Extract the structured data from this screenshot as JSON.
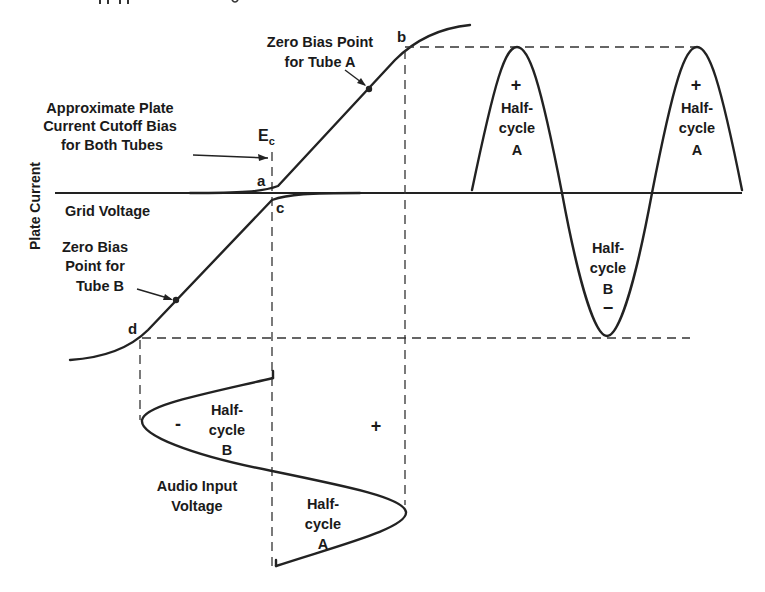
{
  "diagram": {
    "type": "class-B push-pull amplifier transfer characteristic",
    "axis_labels": {
      "vertical": "Plate Current",
      "horizontal": "Grid Voltage"
    },
    "cutoff_annotation": {
      "lines": [
        "Approximate Plate",
        "Current Cutoff Bias",
        "for Both Tubes"
      ],
      "symbol": "E",
      "symbol_subscript": "c"
    },
    "point_labels": {
      "a": "a",
      "b": "b",
      "c": "c",
      "d": "d"
    },
    "zero_bias_a": {
      "lines": [
        "Zero Bias Point",
        "for Tube A"
      ]
    },
    "zero_bias_b": {
      "lines": [
        "Zero Bias",
        "Point for",
        "Tube B"
      ]
    },
    "output_waveform": {
      "half_cycles": [
        {
          "sign": "+",
          "lines": [
            "Half-",
            "cycle",
            "A"
          ]
        },
        {
          "sign": "−",
          "lines": [
            "Half-",
            "cycle",
            "B"
          ]
        },
        {
          "sign": "+",
          "lines": [
            "Half-",
            "cycle",
            "A"
          ]
        }
      ]
    },
    "input_waveform": {
      "label_lines": [
        "Audio Input",
        "Voltage"
      ],
      "half_cycle_b": {
        "sign": "-",
        "lines": [
          "Half-",
          "cycle",
          "B"
        ]
      },
      "half_cycle_a": {
        "sign": "+",
        "lines": [
          "Half-",
          "cycle",
          "A"
        ]
      }
    }
  }
}
